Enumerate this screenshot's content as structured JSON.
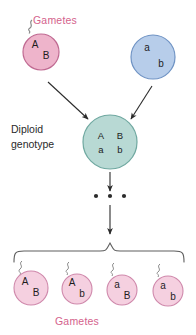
{
  "figure": {
    "type": "genetics-diagram",
    "background_color": "#ffffff"
  },
  "labels": {
    "gametes_top": "Gametes",
    "gametes_bottom": "Gametes",
    "diploid_line1": "Diploid",
    "diploid_line2": "genotype",
    "gametes_color": "#d4628c",
    "diploid_color": "#2a2a2a"
  },
  "parent_gametes": [
    {
      "id": "parent-gamete-pink",
      "allele_top": "A",
      "allele_bottom": "B",
      "fill": "#eeb4cb",
      "stroke": "#c06a92",
      "cx": 41,
      "cy": 52,
      "r": 18,
      "has_tail": true
    },
    {
      "id": "parent-gamete-blue",
      "allele_top": "a",
      "allele_bottom": "b",
      "fill": "#b7cdea",
      "stroke": "#6f93c4",
      "cx": 153,
      "cy": 57,
      "r": 22,
      "has_tail": false
    }
  ],
  "diploid": {
    "id": "diploid-genotype-cell",
    "alleles_top": [
      "A",
      "B"
    ],
    "alleles_bottom": [
      "a",
      "b"
    ],
    "fill": "#b8d9d4",
    "stroke": "#6fa8a0",
    "cx": 110,
    "cy": 142,
    "r": 27
  },
  "meiosis_dots": {
    "count": 3,
    "color": "#2b2b2b"
  },
  "offspring_gametes": [
    {
      "id": "gamete-AB",
      "allele_top": "A",
      "allele_bottom": "B",
      "cx": 31,
      "cy": 288,
      "r": 17
    },
    {
      "id": "gamete-Ab",
      "allele_top": "A",
      "allele_bottom": "b",
      "cx": 77,
      "cy": 288,
      "r": 15
    },
    {
      "id": "gamete-aB",
      "allele_top": "a",
      "allele_bottom": "B",
      "cx": 122,
      "cy": 290,
      "r": 15
    },
    {
      "id": "gamete-ab",
      "allele_top": "a",
      "allele_bottom": "b",
      "cx": 168,
      "cy": 291,
      "r": 15
    }
  ],
  "offspring_style": {
    "fill": "#f5d0e0",
    "stroke": "#cf88ab"
  },
  "arrows": {
    "color": "#2b2b2b",
    "items": [
      {
        "id": "arrow-pink-to-diploid",
        "x1": 48,
        "y1": 82,
        "x2": 88,
        "y2": 119
      },
      {
        "id": "arrow-blue-to-diploid",
        "x1": 152,
        "y1": 86,
        "x2": 131,
        "y2": 119
      },
      {
        "id": "arrow-diploid-to-dots",
        "x1": 110,
        "y1": 172,
        "x2": 110,
        "y2": 190
      },
      {
        "id": "arrow-dots-to-gametes",
        "x1": 110,
        "y1": 207,
        "x2": 110,
        "y2": 233
      }
    ]
  },
  "brace": {
    "id": "offspring-brace",
    "color": "#5e5e5e",
    "left_x": 14,
    "right_x": 184,
    "top_y": 252,
    "apex_x": 110,
    "apex_y": 238
  }
}
